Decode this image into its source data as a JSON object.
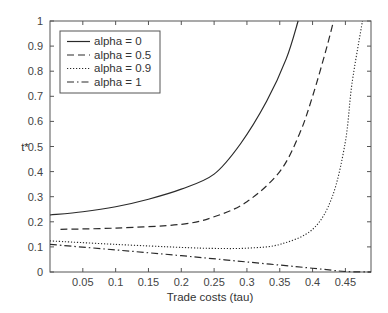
{
  "chart_data": {
    "type": "line",
    "title": "",
    "xlabel": "Trade costs (tau)",
    "ylabel": "t*",
    "xlim": [
      0,
      0.489
    ],
    "ylim": [
      0,
      1
    ],
    "grid": false,
    "legend_position": "upper left",
    "x_ticks": [
      0.05,
      0.1,
      0.15,
      0.2,
      0.25,
      0.3,
      0.35,
      0.4,
      0.45
    ],
    "x_tick_labels": [
      "0.05",
      "0.1",
      "0.15",
      "0.2",
      "0.25",
      "0.3",
      "0.35",
      "0.4",
      "0.45"
    ],
    "y_ticks": [
      0,
      0.1,
      0.2,
      0.3,
      0.4,
      0.5,
      0.6,
      0.7,
      0.8,
      0.9,
      1
    ],
    "y_tick_labels": [
      "0",
      "0.1",
      "0.2",
      "0.3",
      "0.4",
      "0.5",
      "0.6",
      "0.7",
      "0.8",
      "0.9",
      "1"
    ],
    "series": [
      {
        "name": "alpha = 0",
        "style": "solid",
        "x": [
          0.0,
          0.05,
          0.1,
          0.15,
          0.2,
          0.25,
          0.29,
          0.33,
          0.36,
          0.378
        ],
        "y": [
          0.227,
          0.24,
          0.26,
          0.29,
          0.33,
          0.39,
          0.51,
          0.68,
          0.85,
          1.0
        ]
      },
      {
        "name": "alpha = 0.5",
        "style": "dashed",
        "x": [
          0.016,
          0.1,
          0.2,
          0.25,
          0.3,
          0.35,
          0.38,
          0.4,
          0.42,
          0.432
        ],
        "y": [
          0.17,
          0.175,
          0.19,
          0.22,
          0.28,
          0.4,
          0.55,
          0.7,
          0.88,
          1.0
        ]
      },
      {
        "name": "alpha = 0.9",
        "style": "dotted",
        "x": [
          0.0,
          0.1,
          0.2,
          0.25,
          0.3,
          0.35,
          0.4,
          0.43,
          0.45,
          0.46,
          0.476
        ],
        "y": [
          0.124,
          0.11,
          0.098,
          0.094,
          0.095,
          0.11,
          0.17,
          0.3,
          0.52,
          0.75,
          1.0
        ]
      },
      {
        "name": "alpha = 1",
        "style": "dashdot",
        "x": [
          0.0,
          0.1,
          0.2,
          0.3,
          0.4,
          0.45,
          0.489
        ],
        "y": [
          0.11,
          0.088,
          0.065,
          0.04,
          0.015,
          0.002,
          0.0
        ]
      }
    ]
  },
  "legend": {
    "items": [
      {
        "label": "alpha = 0",
        "style": "solid"
      },
      {
        "label": "alpha = 0.5",
        "style": "dashed"
      },
      {
        "label": "alpha = 0.9",
        "style": "dotted"
      },
      {
        "label": "alpha = 1",
        "style": "dashdot"
      }
    ]
  },
  "colors": {
    "line": "#2a2a2a",
    "axis": "#555555",
    "background": "#ffffff"
  }
}
